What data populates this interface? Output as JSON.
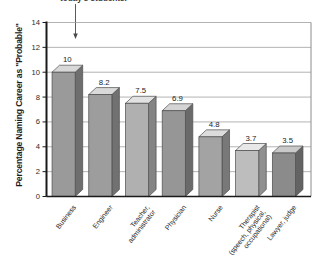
{
  "caption": {
    "clipped_text": "today's students."
  },
  "chart_data": {
    "type": "bar",
    "title": "",
    "subtitle": "",
    "xlabel": "",
    "ylabel": "Percentage Naming Career as \"Probable\"",
    "ylim": [
      0,
      14
    ],
    "ytick_values": [
      0,
      2,
      4,
      6,
      8,
      10,
      12,
      14
    ],
    "ytick_labels": [
      "0",
      "2",
      "4",
      "6",
      "8",
      "10",
      "12",
      "14"
    ],
    "grid": true,
    "legend": null,
    "style": "3d-bar",
    "categories": [
      "Business",
      "Engineer",
      "Teacher, administrator",
      "Physician",
      "Nurse",
      "Therapist (speech, physical, occupational)",
      "Lawyer, judge"
    ],
    "category_lines": [
      [
        "Business"
      ],
      [
        "Engineer"
      ],
      [
        "Teacher,",
        "administrator"
      ],
      [
        "Physician"
      ],
      [
        "Nurse"
      ],
      [
        "Therapist",
        "(speech, physical,",
        "occupational)"
      ],
      [
        "Lawyer, judge"
      ]
    ],
    "values": [
      10,
      8.2,
      7.5,
      6.9,
      4.8,
      3.7,
      3.5
    ],
    "value_labels": [
      "10",
      "8.2",
      "7.5",
      "6.9",
      "4.8",
      "3.7",
      "3.5"
    ],
    "bar_colors": [
      "#9a9a9a",
      "#9d9d9d",
      "#b0b0b0",
      "#969696",
      "#a3a3a3",
      "#bdbdbd",
      "#8b8b8b"
    ],
    "bar_side_colors": [
      "#6e6e6e",
      "#717171",
      "#848484",
      "#6a6a6a",
      "#787878",
      "#909090",
      "#636363"
    ],
    "bar_top_colors": [
      "#d8d8d8",
      "#dadada",
      "#e2e2e2",
      "#d4d4d4",
      "#dcdcdc",
      "#e8e8e8",
      "#c9c9c9"
    ]
  },
  "axes": {
    "axis_color": "#1a1a1a",
    "grid_color": "#9f9f9f",
    "border_color": "#8c8c8c"
  }
}
